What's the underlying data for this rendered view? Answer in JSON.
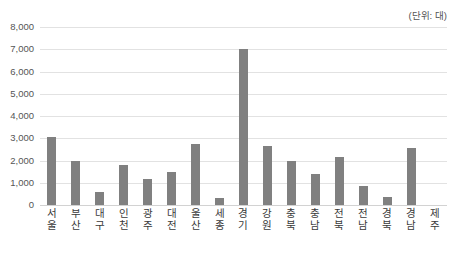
{
  "unit_note": "(단위: 대)",
  "chart_data": {
    "type": "bar",
    "title": "",
    "subtitle": "",
    "xlabel": "",
    "ylabel": "",
    "unit_note": "(단위: 대)",
    "grid": true,
    "legend": null,
    "legend_position": "none",
    "ylim": [
      0,
      8000
    ],
    "ytick_labels": [
      "8,000",
      "7,000",
      "6,000",
      "5,000",
      "4,000",
      "3,000",
      "2,000",
      "1,000",
      "0"
    ],
    "yticks": [
      8000,
      7000,
      6000,
      5000,
      4000,
      3000,
      2000,
      1000,
      0
    ],
    "bar_color": "#808080",
    "gridline_color": "#e2e2e2",
    "text_color": "#555555",
    "categories": [
      "서울",
      "부산",
      "대구",
      "인천",
      "광주",
      "대전",
      "울산",
      "세종",
      "경기",
      "강원",
      "충북",
      "충남",
      "전북",
      "전남",
      "경북",
      "경남",
      "제주"
    ],
    "values": [
      3050,
      1980,
      570,
      1810,
      1190,
      1470,
      2750,
      330,
      7000,
      2670,
      1990,
      1400,
      2140,
      870,
      380,
      2580,
      0
    ]
  }
}
